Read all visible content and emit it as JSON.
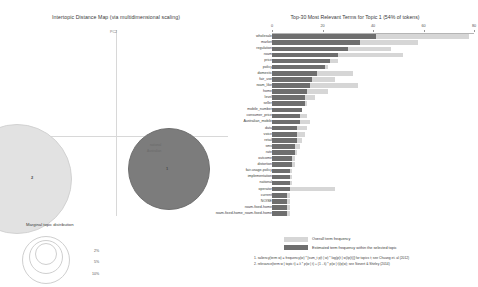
{
  "left": {
    "title": "Intertopic Distance Map (via multidimensional scaling)",
    "axis_x_label": "PC1",
    "axis_y_label": "PC2",
    "topics": [
      {
        "id": "1",
        "label": "1"
      },
      {
        "id": "2",
        "label": "2"
      }
    ],
    "marginal_legend": {
      "title": "Marginal topic distribution",
      "sizes": [
        "2%",
        "5%",
        "10%"
      ]
    },
    "bubble_words": [
      "national",
      "Australian",
      "price",
      "market"
    ]
  },
  "right": {
    "title": "Top-30 Most Relevant Terms for Topic 1 (54% of tokens)",
    "legend": {
      "overall_label": "Overall term frequency",
      "topic_label": "Estimated term frequency within the selected topic",
      "overall_color": "#d6d6d6",
      "topic_color": "#6e6e6e"
    },
    "footnotes": [
      "1. saliency(term w) = frequency(w) * [sum_t p(t | w) * log(p(t | w)/p(t))] for topics t; see Chuang et. al (2012)",
      "2. relevance(term w | topic t) = λ * p(w | t) + (1 - λ) * p(w | t)/p(w); see Sievert & Shirley (2014)"
    ]
  },
  "chart_data": {
    "type": "bar",
    "title": "Top-30 Most Relevant Terms for Topic 1 (54% of tokens)",
    "xlabel": "",
    "ylabel": "",
    "xlim": [
      0,
      80
    ],
    "xticks": [
      0,
      20,
      40,
      60,
      80
    ],
    "grid": false,
    "legend_position": "bottom-left",
    "orientation": "horizontal",
    "categories": [
      "wholesale",
      "market",
      "regulation",
      "roam",
      "price",
      "policy",
      "domestic",
      "fair_use",
      "roam_like",
      "home",
      "level",
      "seller",
      "mobile_number",
      "consumer_price",
      "Australian_mobile",
      "data",
      "voice",
      "retail",
      "sms",
      "rate",
      "outcome",
      "distortion",
      "fair-usage-policy",
      "implementation",
      "national",
      "operator",
      "current",
      "NOISE",
      "roam-fixed-home",
      "roam-fixed-home_roam-fixed-home"
    ],
    "series": [
      {
        "name": "Overall term frequency",
        "color": "#d6d6d6",
        "values": [
          78,
          58,
          47,
          52,
          26,
          22,
          32,
          25,
          34,
          22,
          17,
          14,
          12,
          14,
          15,
          14,
          13,
          12,
          11,
          10,
          9,
          9,
          8,
          8,
          8,
          25,
          7,
          7,
          7,
          7
        ]
      },
      {
        "name": "Estimated term frequency within the selected topic",
        "color": "#6e6e6e",
        "values": [
          41,
          35,
          30,
          26,
          23,
          21,
          18,
          16,
          15,
          14,
          13,
          13,
          12,
          11,
          11,
          10,
          10,
          10,
          9,
          9,
          8,
          8,
          7,
          7,
          7,
          7,
          6,
          6,
          6,
          6
        ]
      }
    ]
  }
}
